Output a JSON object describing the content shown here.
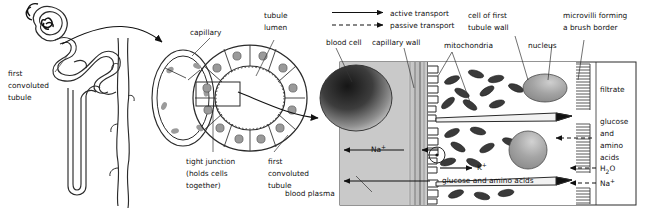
{
  "figure": {
    "panels": [
      "nephron-overview",
      "tubule-cross-section",
      "tubule-cell-detail"
    ]
  },
  "legend": {
    "items": [
      {
        "key": "active",
        "label": "active transport",
        "style": "solid-arrow"
      },
      {
        "key": "passive",
        "label": "passive transport",
        "style": "dashed-arrow"
      }
    ]
  },
  "panel_left": {
    "labels": [
      {
        "name": "first-convoluted-tubule",
        "text": "first\nconvoluted\ntubule",
        "lines": [
          "first",
          "convoluted",
          "tubule"
        ]
      }
    ]
  },
  "panel_middle": {
    "labels": [
      {
        "name": "capillary",
        "lines": [
          "capillary"
        ]
      },
      {
        "name": "tubule-lumen",
        "lines": [
          "tubule",
          "lumen"
        ]
      },
      {
        "name": "tight-junction",
        "lines": [
          "tight junction",
          "(holds cells",
          "together)"
        ]
      },
      {
        "name": "first-convoluted-tubule",
        "lines": [
          "first",
          "convoluted",
          "tubule"
        ]
      }
    ],
    "cell_count": 12
  },
  "panel_right": {
    "labels": [
      {
        "name": "blood-cell",
        "lines": [
          "blood cell"
        ]
      },
      {
        "name": "capillary-wall",
        "lines": [
          "capillary wall"
        ]
      },
      {
        "name": "cell-of-first-tubule-wall",
        "lines": [
          "cell of first",
          "tubule wall"
        ]
      },
      {
        "name": "mitochondria",
        "lines": [
          "mitochondria"
        ]
      },
      {
        "name": "nucleus",
        "lines": [
          "nucleus"
        ]
      },
      {
        "name": "microvilli",
        "lines": [
          "microvilli forming",
          "a brush border"
        ]
      },
      {
        "name": "blood-plasma",
        "lines": [
          "blood plasma"
        ]
      },
      {
        "name": "filtrate",
        "lines": [
          "filtrate"
        ]
      }
    ],
    "transport_labels": [
      {
        "name": "sodium-out",
        "text": "Na",
        "sup": "+",
        "mode": "active",
        "direction": "left"
      },
      {
        "name": "potassium-in",
        "text": "K",
        "sup": "+",
        "mode": "active",
        "direction": "right"
      },
      {
        "name": "glucose-amino-acids-out",
        "text": "glucose and amino acids",
        "mode": "active",
        "direction": "left"
      },
      {
        "name": "glucose-amino-acids-in",
        "lines": [
          "glucose",
          "and",
          "amino",
          "acids"
        ],
        "mode": "passive",
        "direction": "left"
      },
      {
        "name": "water-in",
        "text": "H",
        "sub": "2",
        "text2": "O",
        "mode": "passive",
        "direction": "left"
      },
      {
        "name": "sodium-in",
        "text": "Na",
        "sup": "+",
        "mode": "passive",
        "direction": "left"
      }
    ]
  },
  "colors": {
    "ink": "#2b2b2b",
    "plasma": "#c9c9c9",
    "wall": "#b9b9b9",
    "nucleus": "#9a9a9a",
    "mitochondria": "#3a3a3a",
    "cell_fill": "#ffffff",
    "tubule_fill": "#eeeeee",
    "blood_cell_dark": "#2e2e2e"
  }
}
